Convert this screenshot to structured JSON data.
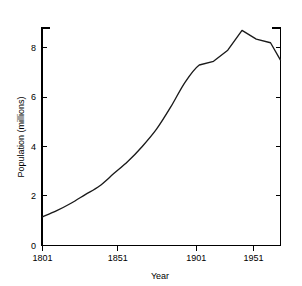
{
  "chart_data": {
    "type": "line",
    "title": "",
    "xlabel": "Year",
    "ylabel": "Population (millions)",
    "xlim": [
      1801,
      1968
    ],
    "ylim": [
      0,
      9.2
    ],
    "xticks": [
      1801,
      1851,
      1901,
      1951
    ],
    "xticklabels": [
      "1801",
      "1851",
      "1901",
      "1951"
    ],
    "yticks": [
      0,
      2,
      4,
      6,
      8
    ],
    "yticklabels": [
      "0",
      "2",
      "4",
      "6",
      "8"
    ],
    "grid": false,
    "legend": null,
    "line_color": "#1a1a1a",
    "series": [
      {
        "name": "Population",
        "x": [
          1801,
          1811,
          1821,
          1831,
          1841,
          1851,
          1861,
          1871,
          1881,
          1891,
          1901,
          1911,
          1921,
          1931,
          1941,
          1951,
          1961,
          1968
        ],
        "values": [
          1.15,
          1.4,
          1.7,
          2.05,
          2.4,
          2.9,
          3.4,
          4.0,
          4.7,
          5.6,
          6.6,
          7.3,
          7.45,
          7.9,
          8.7,
          8.35,
          8.2,
          7.5
        ]
      }
    ]
  },
  "axes": {
    "y_tick_labels": [
      "8",
      "6",
      "4",
      "2",
      "0"
    ],
    "x_tick_labels": [
      "1801",
      "1851",
      "1901",
      "1951"
    ],
    "y_axis_title": "Population (millions)",
    "x_axis_title": "Year"
  }
}
